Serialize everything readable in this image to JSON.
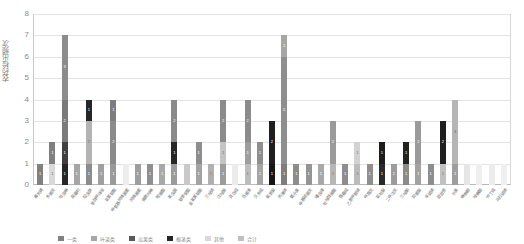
{
  "chart_data": {
    "type": "bar",
    "stacked": true,
    "title": "",
    "xlabel": "",
    "ylabel": "农药检出频次",
    "ylim": [
      0,
      8
    ],
    "yticks": [
      0,
      1,
      2,
      3,
      4,
      5,
      6,
      7,
      8
    ],
    "grid": true,
    "legend_position": "bottom",
    "bar_color_palette": [
      "#d9d9d9",
      "#a6a6a6",
      "#808080",
      "#595959",
      "#262626",
      "#bfbfbf",
      "#f2f2f2"
    ],
    "series": [
      {
        "name": "一级",
        "color": "#808080"
      },
      {
        "name": "二级",
        "color": "#d9d9d9"
      },
      {
        "name": "三级",
        "color": "#262626"
      },
      {
        "name": "四级",
        "color": "#a6a6a6"
      },
      {
        "name": "五级",
        "color": "#bfbfbf"
      },
      {
        "name": "六级",
        "color": "#f2f2f2"
      }
    ],
    "categories": [
      "毒死蜱",
      "多菌灵",
      "吡虫啉",
      "腐霉利",
      "啶虫脒",
      "苯醚甲环唑",
      "氯氰菊酯",
      "甲氨基阿维菌素",
      "阿维菌素",
      "烯酰吗啉",
      "嘧菌酯",
      "氟虫腈",
      "联苯菊酯",
      "氯氟氰菊酯",
      "三唑磷",
      "戊唑醇",
      "克百威",
      "百菌清",
      "灭多威",
      "氟苯脲",
      "丙溴磷",
      "氧乐果",
      "甲基硫菌灵",
      "噻虫嗪",
      "吡唑醚菌酯",
      "霜霉威",
      "乙酰甲胺磷",
      "甲霜灵",
      "氯吡脲",
      "二甲戊灵",
      "三唑酮",
      "异菌脲",
      "辛硫磷",
      "敌敌畏",
      "乐果",
      "咪鲜胺",
      "唑螨酯",
      "仲丁威",
      "马拉硫磷"
    ],
    "bars": [
      {
        "label": "毒死蜱",
        "total": 1,
        "segments": [
          {
            "value": 1,
            "color": "#808080",
            "text": "1"
          }
        ]
      },
      {
        "label": "多菌灵",
        "total": 2,
        "segments": [
          {
            "value": 1,
            "color": "#d9d9d9",
            "text": "1"
          },
          {
            "value": 1,
            "color": "#808080",
            "text": "1"
          }
        ]
      },
      {
        "label": "吡虫啉",
        "total": 7,
        "segments": [
          {
            "value": 1,
            "color": "#262626",
            "text": "1"
          },
          {
            "value": 1,
            "color": "#404040",
            "text": "1"
          },
          {
            "value": 2,
            "color": "#7a7a7a",
            "text": "2"
          },
          {
            "value": 3,
            "color": "#8c8c8c",
            "text": "3"
          }
        ]
      },
      {
        "label": "腐霉利",
        "total": 1,
        "segments": [
          {
            "value": 1,
            "color": "#a6a6a6",
            "text": "1"
          }
        ]
      },
      {
        "label": "啶虫脒",
        "total": 4,
        "segments": [
          {
            "value": 1,
            "color": "#8c8c8c",
            "text": "1"
          },
          {
            "value": 2,
            "color": "#b3b3b3",
            "text": "2"
          },
          {
            "value": 1,
            "color": "#262626",
            "text": "1"
          }
        ]
      },
      {
        "label": "苯醚甲环唑",
        "total": 1,
        "segments": [
          {
            "value": 1,
            "color": "#a0a0a0",
            "text": "1"
          }
        ]
      },
      {
        "label": "氯氰菊酯",
        "total": 4,
        "segments": [
          {
            "value": 1,
            "color": "#9a9a9a",
            "text": "1"
          },
          {
            "value": 2,
            "color": "#8a8a8a",
            "text": "2"
          },
          {
            "value": 1,
            "color": "#7d7d7d",
            "text": "1"
          }
        ]
      },
      {
        "label": "甲氨基阿维菌素",
        "total": 1,
        "segments": [
          {
            "value": 1,
            "color": "#ededed",
            "text": ""
          }
        ]
      },
      {
        "label": "阿维菌素",
        "total": 1,
        "segments": [
          {
            "value": 1,
            "color": "#9e9e9e",
            "text": "1"
          }
        ]
      },
      {
        "label": "烯酰吗啉",
        "total": 1,
        "segments": [
          {
            "value": 1,
            "color": "#8f8f8f",
            "text": "1"
          }
        ]
      },
      {
        "label": "嘧菌酯",
        "total": 1,
        "segments": [
          {
            "value": 1,
            "color": "#a8a8a8",
            "text": "1"
          }
        ]
      },
      {
        "label": "氟虫腈",
        "total": 4,
        "segments": [
          {
            "value": 1,
            "color": "#9b9b9b",
            "text": "1"
          },
          {
            "value": 1,
            "color": "#262626",
            "text": "1"
          },
          {
            "value": 2,
            "color": "#8a8a8a",
            "text": "2"
          }
        ]
      },
      {
        "label": "联苯菊酯",
        "total": 1,
        "segments": [
          {
            "value": 1,
            "color": "#c9c9c9",
            "text": ""
          }
        ]
      },
      {
        "label": "氯氟氰菊酯",
        "total": 2,
        "segments": [
          {
            "value": 1,
            "color": "#a3a3a3",
            "text": "1"
          },
          {
            "value": 1,
            "color": "#8d8d8d",
            "text": "1"
          }
        ]
      },
      {
        "label": "三唑磷",
        "total": 1,
        "segments": [
          {
            "value": 1,
            "color": "#b0b0b0",
            "text": "1"
          }
        ]
      },
      {
        "label": "戊唑醇",
        "total": 4,
        "segments": [
          {
            "value": 1,
            "color": "#9c9c9c",
            "text": "1"
          },
          {
            "value": 1,
            "color": "#c4c4c4",
            "text": "1"
          },
          {
            "value": 2,
            "color": "#8b8b8b",
            "text": "2"
          }
        ]
      },
      {
        "label": "克百威",
        "total": 1,
        "segments": [
          {
            "value": 1,
            "color": "#ebebeb",
            "text": ""
          }
        ]
      },
      {
        "label": "百菌清",
        "total": 4,
        "segments": [
          {
            "value": 1,
            "color": "#bdbdbd",
            "text": "1"
          },
          {
            "value": 1,
            "color": "#9d9d9d",
            "text": "1"
          },
          {
            "value": 2,
            "color": "#8b8b8b",
            "text": "2"
          }
        ]
      },
      {
        "label": "灭多威",
        "total": 2,
        "segments": [
          {
            "value": 1,
            "color": "#a5a5a5",
            "text": "1"
          },
          {
            "value": 1,
            "color": "#8e8e8e",
            "text": "1"
          }
        ]
      },
      {
        "label": "氟苯脲",
        "total": 3,
        "segments": [
          {
            "value": 1,
            "color": "#161616",
            "text": "1"
          },
          {
            "value": 2,
            "color": "#1f1f1f",
            "text": "2"
          }
        ]
      },
      {
        "label": "丙溴磷",
        "total": 7,
        "segments": [
          {
            "value": 1,
            "color": "#7e7e7e",
            "text": "1"
          },
          {
            "value": 5,
            "color": "#8f8f8f",
            "text": "5"
          },
          {
            "value": 1,
            "color": "#a6a6a6",
            "text": "1"
          }
        ]
      },
      {
        "label": "氧乐果",
        "total": 1,
        "segments": [
          {
            "value": 1,
            "color": "#8c8c8c",
            "text": "1"
          }
        ]
      },
      {
        "label": "甲基硫菌灵",
        "total": 1,
        "segments": [
          {
            "value": 1,
            "color": "#949494",
            "text": "1"
          }
        ]
      },
      {
        "label": "噻虫嗪",
        "total": 1,
        "segments": [
          {
            "value": 1,
            "color": "#a8a8a8",
            "text": "1"
          }
        ]
      },
      {
        "label": "吡唑醚菌酯",
        "total": 3,
        "segments": [
          {
            "value": 1,
            "color": "#b6b6b6",
            "text": "1"
          },
          {
            "value": 2,
            "color": "#9a9a9a",
            "text": "2"
          }
        ]
      },
      {
        "label": "霜霉威",
        "total": 1,
        "segments": [
          {
            "value": 1,
            "color": "#8e8e8e",
            "text": "1"
          }
        ]
      },
      {
        "label": "乙酰甲胺磷",
        "total": 2,
        "segments": [
          {
            "value": 1,
            "color": "#bcbcbc",
            "text": "1"
          },
          {
            "value": 1,
            "color": "#d2d2d2",
            "text": "1"
          }
        ]
      },
      {
        "label": "甲霜灵",
        "total": 1,
        "segments": [
          {
            "value": 1,
            "color": "#8f8f8f",
            "text": "1"
          }
        ]
      },
      {
        "label": "氯吡脲",
        "total": 2,
        "segments": [
          {
            "value": 1,
            "color": "#2a2a2a",
            "text": "1"
          },
          {
            "value": 1,
            "color": "#1c1c1c",
            "text": "1"
          }
        ]
      },
      {
        "label": "二甲戊灵",
        "total": 1,
        "segments": [
          {
            "value": 1,
            "color": "#9c9c9c",
            "text": "1"
          }
        ]
      },
      {
        "label": "三唑酮",
        "total": 2,
        "segments": [
          {
            "value": 1,
            "color": "#8b8b8b",
            "text": "1"
          },
          {
            "value": 1,
            "color": "#212121",
            "text": "1"
          }
        ]
      },
      {
        "label": "异菌脲",
        "total": 3,
        "segments": [
          {
            "value": 1,
            "color": "#a2a2a2",
            "text": "1"
          },
          {
            "value": 2,
            "color": "#9a9a9a",
            "text": "2"
          }
        ]
      },
      {
        "label": "辛硫磷",
        "total": 1,
        "segments": [
          {
            "value": 1,
            "color": "#8d8d8d",
            "text": "1"
          }
        ]
      },
      {
        "label": "敌敌畏",
        "total": 3,
        "segments": [
          {
            "value": 1,
            "color": "#c1c1c1",
            "text": "1"
          },
          {
            "value": 2,
            "color": "#1e1e1e",
            "text": "2"
          }
        ]
      },
      {
        "label": "乐果",
        "total": 4,
        "segments": [
          {
            "value": 1,
            "color": "#9e9e9e",
            "text": "1"
          },
          {
            "value": 3,
            "color": "#b5b5b5",
            "text": "3"
          }
        ]
      },
      {
        "label": "咪鲜胺",
        "total": 1,
        "segments": [
          {
            "value": 1,
            "color": "#e6e6e6",
            "text": ""
          }
        ]
      },
      {
        "label": "唑螨酯",
        "total": 1,
        "segments": [
          {
            "value": 1,
            "color": "#efefef",
            "text": ""
          }
        ]
      },
      {
        "label": "仲丁威",
        "total": 1,
        "segments": [
          {
            "value": 1,
            "color": "#ececec",
            "text": ""
          }
        ]
      },
      {
        "label": "马拉硫磷",
        "total": 1,
        "segments": [
          {
            "value": 1,
            "color": "#f0f0f0",
            "text": ""
          }
        ]
      }
    ]
  },
  "legend": [
    {
      "label": "一类",
      "color": "#808080"
    },
    {
      "label": "叶菜类",
      "color": "#a6a6a6"
    },
    {
      "label": "瓜果类",
      "color": "#595959"
    },
    {
      "label": "根茎类",
      "color": "#262626"
    },
    {
      "label": "其他",
      "color": "#d9d9d9"
    },
    {
      "label": "合计",
      "color": "#bfbfbf"
    }
  ]
}
